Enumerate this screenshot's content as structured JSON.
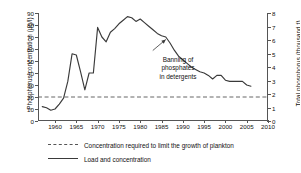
{
  "chart_data": {
    "type": "line",
    "title": "",
    "xlabel": "",
    "ylabel": "Phosphorus concentration (µg/l)",
    "y2label": "Total phosphorus (thousand t)",
    "xlim": [
      1956,
      2010
    ],
    "ylim": [
      0,
      90
    ],
    "y2lim": [
      0,
      8
    ],
    "xticks": [
      1960,
      1965,
      1970,
      1975,
      1980,
      1985,
      1990,
      1995,
      2000,
      2005,
      2010
    ],
    "yticks": [
      0,
      10,
      20,
      30,
      40,
      50,
      60,
      70,
      80,
      90
    ],
    "y2ticks": [
      0,
      1,
      2,
      3,
      4,
      5,
      6,
      7,
      8
    ],
    "grid": false,
    "legend_position": "below",
    "series": [
      {
        "name": "Load and concentration",
        "style": "solid",
        "color": "#3a3a3a",
        "x": [
          1957,
          1958,
          1959,
          1960,
          1961,
          1962,
          1963,
          1964,
          1965,
          1966,
          1967,
          1968,
          1969,
          1970,
          1971,
          1972,
          1973,
          1974,
          1975,
          1976,
          1977,
          1978,
          1979,
          1980,
          1981,
          1982,
          1983,
          1984,
          1985,
          1986,
          1987,
          1988,
          1989,
          1990,
          1991,
          1992,
          1993,
          1994,
          1995,
          1996,
          1997,
          1998,
          1999,
          2000,
          2001,
          2002,
          2003,
          2004,
          2005,
          2006
        ],
        "values": [
          12,
          11,
          9,
          10,
          14,
          19,
          33,
          56,
          55,
          41,
          26,
          40,
          40,
          78,
          70,
          66,
          74,
          77,
          81,
          84,
          87,
          86,
          83,
          85,
          82,
          79,
          76,
          73,
          71,
          70,
          65,
          59,
          54,
          51,
          48,
          45,
          43,
          41,
          40,
          38,
          35,
          38,
          38,
          34,
          33,
          33,
          33,
          33,
          30,
          29
        ]
      },
      {
        "name": "Concentration required to limit the growth of plankton",
        "style": "dashed",
        "color": "#555555",
        "constant_value": 20,
        "x": [
          1956,
          2010
        ],
        "values": [
          20,
          20
        ]
      }
    ],
    "annotations": [
      {
        "text": "Banning of phosphates in detergents",
        "lines": [
          "Banning of",
          "phosphates",
          "in detergents"
        ],
        "points_to_year": 1986,
        "points_to_value": 70
      }
    ]
  },
  "legend": {
    "items": [
      {
        "label": "Concentration required to limit the growth of plankton",
        "style": "dashed"
      },
      {
        "label": "Load and concentration",
        "style": "solid"
      }
    ]
  }
}
